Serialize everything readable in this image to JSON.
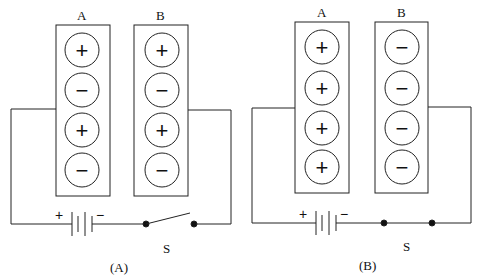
{
  "figures": [
    {
      "caption": "(A)",
      "plate_a": {
        "label": "A",
        "charges": [
          "+",
          "−",
          "+",
          "−"
        ]
      },
      "plate_b": {
        "label": "B",
        "charges": [
          "+",
          "−",
          "+",
          "−"
        ]
      },
      "battery": {
        "plus": "+",
        "minus": "−"
      },
      "switch": {
        "label": "S",
        "state": "open"
      }
    },
    {
      "caption": "(B)",
      "plate_a": {
        "label": "A",
        "charges": [
          "+",
          "+",
          "+",
          "+"
        ]
      },
      "plate_b": {
        "label": "B",
        "charges": [
          "−",
          "−",
          "−",
          "−"
        ]
      },
      "battery": {
        "plus": "+",
        "minus": "−"
      },
      "switch": {
        "label": "S",
        "state": "closed"
      }
    }
  ]
}
